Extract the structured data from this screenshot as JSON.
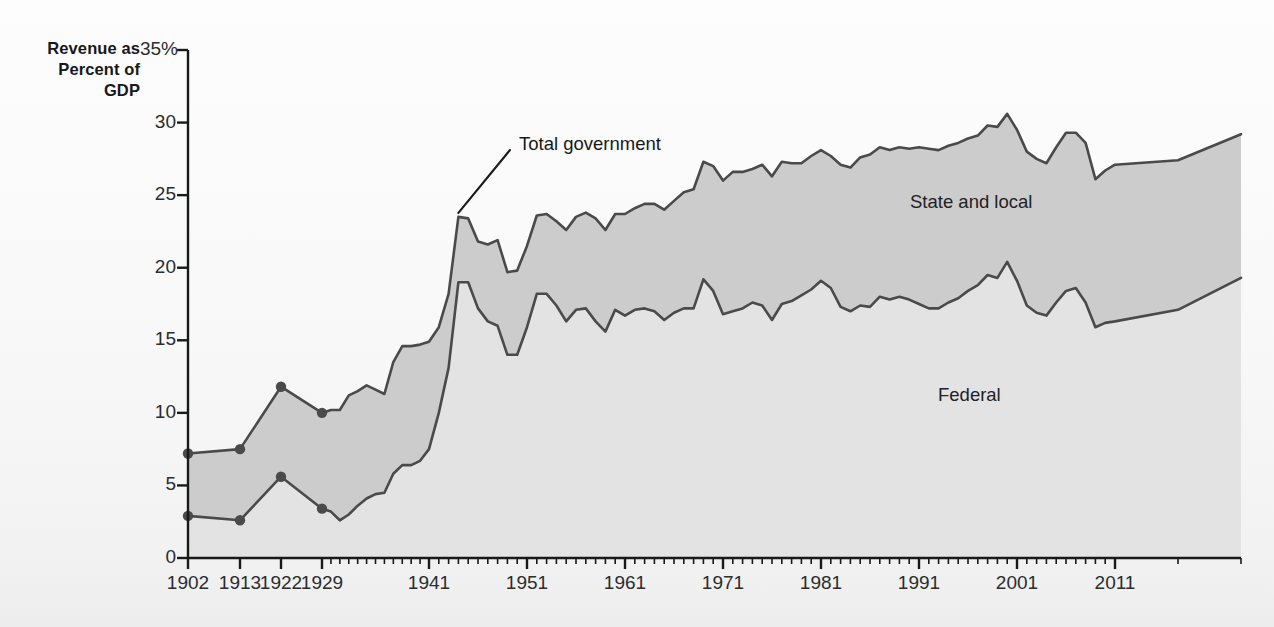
{
  "axis_title": "Revenue as\nPercent of\nGDP",
  "axis_title_lines": [
    "Revenue as",
    "Percent of",
    "GDP"
  ],
  "labels": {
    "total_government": "Total government",
    "state_and_local": "State and local",
    "federal": "Federal"
  },
  "colors": {
    "federal_fill": "#e3e3e3",
    "state_local_fill": "#cccccc",
    "line": "#4a4a4a",
    "axis": "#17191b",
    "text": "#1f2123",
    "background": "#fbfbfb"
  },
  "chart_data": {
    "type": "area",
    "title": "",
    "xlabel": "",
    "ylabel": "Revenue as Percent of GDP",
    "ylim": [
      0,
      35
    ],
    "yticks": [
      0,
      5,
      10,
      15,
      20,
      25,
      30,
      35
    ],
    "ytick_labels": [
      "0",
      "5",
      "10",
      "15",
      "20",
      "25",
      "30",
      "35%"
    ],
    "xticks_labeled": [
      1902,
      1913,
      1922,
      1929,
      1941,
      1951,
      1961,
      1971,
      1981,
      1991,
      2001,
      2011
    ],
    "xtick_labels": [
      "1902",
      "1913",
      "1922",
      "1929",
      "1941",
      "1951",
      "1961",
      "1971",
      "1981",
      "1991",
      "2001",
      "2011"
    ],
    "grid": false,
    "legend": "in-plot area labels",
    "stacked": true,
    "annotations": [
      {
        "text": "Total government",
        "points_to_year": 1944,
        "points_to_value": 23.6
      }
    ],
    "marker_years": [
      1902,
      1913,
      1922,
      1929
    ],
    "x": [
      1902,
      1913,
      1922,
      1929,
      1930,
      1931,
      1932,
      1933,
      1934,
      1935,
      1936,
      1937,
      1938,
      1939,
      1940,
      1941,
      1942,
      1943,
      1944,
      1945,
      1946,
      1947,
      1948,
      1949,
      1950,
      1951,
      1952,
      1953,
      1954,
      1955,
      1956,
      1957,
      1958,
      1959,
      1960,
      1961,
      1962,
      1963,
      1964,
      1965,
      1966,
      1967,
      1968,
      1969,
      1970,
      1971,
      1972,
      1973,
      1974,
      1975,
      1976,
      1977,
      1978,
      1979,
      1980,
      1981,
      1982,
      1983,
      1984,
      1985,
      1986,
      1987,
      1988,
      1989,
      1990,
      1991,
      1992,
      1993,
      1994,
      1995,
      1996,
      1997,
      1998,
      1999,
      2000,
      2001,
      2002,
      2003,
      2004,
      2005,
      2006,
      2007,
      2008,
      2009,
      2010,
      2011,
      2012,
      2013
    ],
    "series": [
      {
        "name": "Federal",
        "fill": "#e3e3e3",
        "values": [
          2.9,
          2.6,
          5.6,
          3.4,
          3.2,
          2.6,
          3.0,
          3.6,
          4.1,
          4.4,
          4.5,
          5.8,
          6.4,
          6.4,
          6.7,
          7.5,
          10.0,
          13.1,
          19.0,
          19.0,
          17.2,
          16.3,
          16.0,
          14.0,
          14.0,
          15.9,
          18.2,
          18.2,
          17.4,
          16.3,
          17.1,
          17.2,
          16.3,
          15.6,
          17.1,
          16.7,
          17.1,
          17.2,
          17.0,
          16.4,
          16.9,
          17.2,
          17.2,
          19.2,
          18.4,
          16.8,
          17.0,
          17.2,
          17.6,
          17.4,
          16.4,
          17.5,
          17.7,
          18.1,
          18.5,
          19.1,
          18.6,
          17.3,
          17.0,
          17.4,
          17.3,
          18.0,
          17.8,
          18.0,
          17.8,
          17.5,
          17.2,
          17.2,
          17.6,
          17.9,
          18.4,
          18.8,
          19.5,
          19.3,
          20.4,
          19.1,
          17.4,
          16.9,
          16.7,
          17.6,
          18.4,
          18.6,
          17.6,
          15.9,
          16.2,
          16.3,
          17.1,
          19.3
        ]
      },
      {
        "name": "State and local",
        "fill": "#cccccc",
        "values": [
          4.3,
          4.9,
          6.2,
          6.6,
          7.0,
          7.6,
          8.2,
          7.9,
          7.8,
          7.2,
          6.8,
          7.7,
          8.2,
          8.2,
          8.0,
          7.4,
          5.9,
          5.1,
          4.5,
          4.4,
          4.6,
          5.3,
          5.9,
          5.7,
          5.8,
          5.6,
          5.4,
          5.5,
          5.8,
          6.3,
          6.4,
          6.6,
          7.1,
          7.0,
          6.6,
          7.0,
          7.0,
          7.2,
          7.4,
          7.6,
          7.7,
          8.0,
          8.2,
          8.1,
          8.6,
          9.2,
          9.6,
          9.4,
          9.2,
          9.7,
          9.9,
          9.8,
          9.5,
          9.1,
          9.2,
          9.0,
          9.1,
          9.8,
          9.9,
          10.2,
          10.5,
          10.3,
          10.3,
          10.3,
          10.4,
          10.8,
          11.0,
          10.9,
          10.8,
          10.7,
          10.5,
          10.3,
          10.3,
          10.4,
          10.2,
          10.4,
          10.6,
          10.6,
          10.5,
          10.7,
          10.9,
          10.7,
          11.0,
          10.2,
          10.5,
          10.8,
          10.3,
          9.9
        ]
      }
    ],
    "total": {
      "name": "Total government",
      "values": [
        7.2,
        7.5,
        11.8,
        10.0,
        10.2,
        10.2,
        11.2,
        11.5,
        11.9,
        11.6,
        11.3,
        13.5,
        14.6,
        14.6,
        14.7,
        14.9,
        15.9,
        18.2,
        23.5,
        23.4,
        21.8,
        21.6,
        21.9,
        19.7,
        19.8,
        21.5,
        23.6,
        23.7,
        23.2,
        22.6,
        23.5,
        23.8,
        23.4,
        22.6,
        23.7,
        23.7,
        24.1,
        24.4,
        24.4,
        24.0,
        24.6,
        25.2,
        25.4,
        27.3,
        27.0,
        26.0,
        26.6,
        26.6,
        26.8,
        27.1,
        26.3,
        27.3,
        27.2,
        27.2,
        27.7,
        28.1,
        27.7,
        27.1,
        26.9,
        27.6,
        27.8,
        28.3,
        28.1,
        28.3,
        28.2,
        28.3,
        28.2,
        28.1,
        28.4,
        28.6,
        28.9,
        29.1,
        29.8,
        29.7,
        30.6,
        29.5,
        28.0,
        27.5,
        27.2,
        28.3,
        29.3,
        29.3,
        28.6,
        26.1,
        26.7,
        27.1,
        27.4,
        29.2
      ]
    }
  }
}
